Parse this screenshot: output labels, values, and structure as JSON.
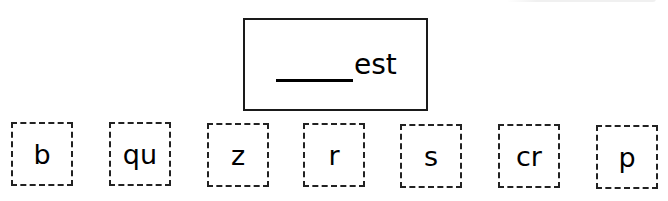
{
  "worksheet": {
    "target_word": {
      "blank": "_____",
      "ending": "est"
    },
    "letter_tiles": [
      {
        "label": "b"
      },
      {
        "label": "qu"
      },
      {
        "label": "z"
      },
      {
        "label": "r"
      },
      {
        "label": "s"
      },
      {
        "label": "cr"
      },
      {
        "label": "p"
      }
    ]
  }
}
